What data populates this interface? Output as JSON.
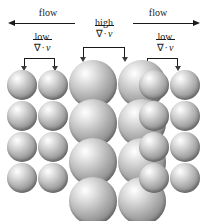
{
  "figure": {
    "name": "divergence-flow-sphere-diagram",
    "background_color": "#ffffff",
    "width": 208,
    "height": 221
  },
  "flow": {
    "left_label": "flow",
    "right_label": "flow",
    "left_direction": "left",
    "right_direction": "right"
  },
  "center": {
    "magnitude_label": "high",
    "expression": {
      "nabla": "∇",
      "operator": "·",
      "vector": "v"
    }
  },
  "annotations": [
    {
      "id": "left-low-divergence",
      "magnitude_label": "low",
      "expression": {
        "nabla": "∇",
        "operator": "·",
        "vector": "v"
      },
      "position": "left"
    },
    {
      "id": "right-low-divergence",
      "magnitude_label": "low",
      "expression": {
        "nabla": "∇",
        "operator": "·",
        "vector": "v"
      },
      "position": "right"
    }
  ],
  "sphere_groups": [
    {
      "id": "left-group",
      "region": "left",
      "columns": 2,
      "rows": 4,
      "sphere_diameter": 30,
      "size_class": "small"
    },
    {
      "id": "center-group",
      "region": "center",
      "columns": 2,
      "rows": 4,
      "sphere_diameter": 48,
      "size_class": "large"
    },
    {
      "id": "right-group",
      "region": "right",
      "columns": 2,
      "rows": 4,
      "sphere_diameter": 30,
      "size_class": "small"
    }
  ],
  "colors": {
    "ink": "#1a1a1a",
    "sphere_highlight": "#ffffff",
    "sphere_mid": "#b4b4b4",
    "sphere_shadow": "#6e6e6e"
  }
}
